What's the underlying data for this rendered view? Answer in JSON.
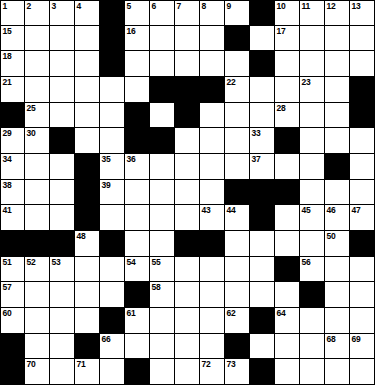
{
  "puzzle": {
    "title": "Crossword Grid",
    "type": "crossword",
    "rows": 15,
    "cols": 15,
    "colors": {
      "block": "#000000",
      "open": "#ffffff",
      "border": "#000000",
      "number_text": "#000000"
    },
    "legend": {
      "block_symbol": "#",
      "open_symbol": "."
    },
    "grid": [
      "....#.....#.....",
      "....#....#.....#",
      "....#.....#.....",
      "......###.....#.",
      "#....#.#......#.",
      "..#..##....#....",
      "...#.........#..",
      "...#.....###....",
      "...#......#.....",
      "###.#..##.....#.",
      "...........#....",
      ".....#......#...",
      "....#.....#.....",
      "#..#.....#......",
      "#....#....#....."
    ],
    "numbers": [
      {
        "row": 0,
        "col": 0,
        "n": "1"
      },
      {
        "row": 0,
        "col": 1,
        "n": "2"
      },
      {
        "row": 0,
        "col": 2,
        "n": "3"
      },
      {
        "row": 0,
        "col": 3,
        "n": "4"
      },
      {
        "row": 0,
        "col": 5,
        "n": "5"
      },
      {
        "row": 0,
        "col": 6,
        "n": "6"
      },
      {
        "row": 0,
        "col": 7,
        "n": "7"
      },
      {
        "row": 0,
        "col": 8,
        "n": "8"
      },
      {
        "row": 0,
        "col": 9,
        "n": "9"
      },
      {
        "row": 0,
        "col": 11,
        "n": "10"
      },
      {
        "row": 0,
        "col": 12,
        "n": "11"
      },
      {
        "row": 0,
        "col": 13,
        "n": "12"
      },
      {
        "row": 0,
        "col": 14,
        "n": "13"
      },
      {
        "row": 1,
        "col": 0,
        "n": "15"
      },
      {
        "row": 1,
        "col": 5,
        "n": "16"
      },
      {
        "row": 1,
        "col": 11,
        "n": "17"
      },
      {
        "row": 2,
        "col": 0,
        "n": "18"
      },
      {
        "row": 2,
        "col": 4,
        "n": "19"
      },
      {
        "row": 2,
        "col": 10,
        "n": "20"
      },
      {
        "row": 3,
        "col": 0,
        "n": "21"
      },
      {
        "row": 3,
        "col": 9,
        "n": "22"
      },
      {
        "row": 3,
        "col": 12,
        "n": "23"
      },
      {
        "row": 3,
        "col": 14,
        "n": "24"
      },
      {
        "row": 4,
        "col": 1,
        "n": "25"
      },
      {
        "row": 4,
        "col": 5,
        "n": "26"
      },
      {
        "row": 4,
        "col": 7,
        "n": "27"
      },
      {
        "row": 4,
        "col": 11,
        "n": "28"
      },
      {
        "row": 5,
        "col": 0,
        "n": "29"
      },
      {
        "row": 5,
        "col": 1,
        "n": "30"
      },
      {
        "row": 5,
        "col": 5,
        "n": "31"
      },
      {
        "row": 5,
        "col": 6,
        "n": "32"
      },
      {
        "row": 5,
        "col": 10,
        "n": "33"
      },
      {
        "row": 6,
        "col": 0,
        "n": "34"
      },
      {
        "row": 6,
        "col": 4,
        "n": "35"
      },
      {
        "row": 6,
        "col": 5,
        "n": "36"
      },
      {
        "row": 6,
        "col": 10,
        "n": "37"
      },
      {
        "row": 7,
        "col": 0,
        "n": "38"
      },
      {
        "row": 7,
        "col": 4,
        "n": "39"
      },
      {
        "row": 7,
        "col": 10,
        "n": "40"
      },
      {
        "row": 8,
        "col": 0,
        "n": "41"
      },
      {
        "row": 8,
        "col": 3,
        "n": "42"
      },
      {
        "row": 8,
        "col": 8,
        "n": "43"
      },
      {
        "row": 8,
        "col": 9,
        "n": "44"
      },
      {
        "row": 8,
        "col": 12,
        "n": "45"
      },
      {
        "row": 8,
        "col": 13,
        "n": "46"
      },
      {
        "row": 8,
        "col": 14,
        "n": "47"
      },
      {
        "row": 9,
        "col": 3,
        "n": "48"
      },
      {
        "row": 9,
        "col": 7,
        "n": "49"
      },
      {
        "row": 9,
        "col": 13,
        "n": "50"
      },
      {
        "row": 10,
        "col": 0,
        "n": "51"
      },
      {
        "row": 10,
        "col": 1,
        "n": "52"
      },
      {
        "row": 10,
        "col": 2,
        "n": "53"
      },
      {
        "row": 10,
        "col": 5,
        "n": "54"
      },
      {
        "row": 10,
        "col": 6,
        "n": "55"
      },
      {
        "row": 10,
        "col": 12,
        "n": "56"
      },
      {
        "row": 11,
        "col": 0,
        "n": "57"
      },
      {
        "row": 11,
        "col": 6,
        "n": "58"
      },
      {
        "row": 11,
        "col": 12,
        "n": "59"
      },
      {
        "row": 12,
        "col": 0,
        "n": "60"
      },
      {
        "row": 12,
        "col": 5,
        "n": "61"
      },
      {
        "row": 12,
        "col": 9,
        "n": "62"
      },
      {
        "row": 12,
        "col": 10,
        "n": "63"
      },
      {
        "row": 12,
        "col": 11,
        "n": "64"
      },
      {
        "row": 13,
        "col": 0,
        "n": "65"
      },
      {
        "row": 13,
        "col": 4,
        "n": "66"
      },
      {
        "row": 13,
        "col": 9,
        "n": "67"
      },
      {
        "row": 13,
        "col": 13,
        "n": "68"
      },
      {
        "row": 13,
        "col": 14,
        "n": "69"
      },
      {
        "row": 14,
        "col": 1,
        "n": "70"
      },
      {
        "row": 14,
        "col": 3,
        "n": "71"
      },
      {
        "row": 14,
        "col": 8,
        "n": "72"
      },
      {
        "row": 14,
        "col": 9,
        "n": "73"
      },
      {
        "row": 14,
        "col": 10,
        "n": "74"
      }
    ]
  }
}
